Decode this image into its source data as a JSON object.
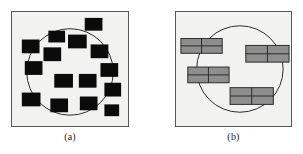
{
  "figure": {
    "background_color": "#ffffff",
    "width": 303,
    "height": 154
  },
  "panels": [
    {
      "id": "a",
      "caption": "(a)",
      "background_color": "#f2f2f0",
      "border_color": "#55555a",
      "query_circle": {
        "label": "query-region-circle",
        "cx": 59,
        "cy": 61,
        "r": 44,
        "stroke": "#2a2a2a",
        "stroke_width": 1,
        "fill": "none"
      },
      "object_shape": "square",
      "object_fill": "#0b0b0b",
      "objects": [
        {
          "name": "data-object-1",
          "x": 74,
          "y": 6,
          "w": 18,
          "h": 13
        },
        {
          "name": "data-object-2",
          "x": 37,
          "y": 19,
          "w": 17,
          "h": 12
        },
        {
          "name": "data-object-3",
          "x": 10,
          "y": 28,
          "w": 18,
          "h": 14
        },
        {
          "name": "data-object-4",
          "x": 57,
          "y": 23,
          "w": 19,
          "h": 14
        },
        {
          "name": "data-object-5",
          "x": 80,
          "y": 33,
          "w": 18,
          "h": 14
        },
        {
          "name": "data-object-6",
          "x": 32,
          "y": 36,
          "w": 18,
          "h": 14
        },
        {
          "name": "data-object-7",
          "x": 13,
          "y": 50,
          "w": 18,
          "h": 14
        },
        {
          "name": "data-object-8",
          "x": 90,
          "y": 52,
          "w": 18,
          "h": 14
        },
        {
          "name": "data-object-9",
          "x": 43,
          "y": 63,
          "w": 19,
          "h": 14
        },
        {
          "name": "data-object-10",
          "x": 68,
          "y": 63,
          "w": 18,
          "h": 14
        },
        {
          "name": "data-object-11",
          "x": 94,
          "y": 72,
          "w": 17,
          "h": 14
        },
        {
          "name": "data-object-12",
          "x": 10,
          "y": 82,
          "w": 19,
          "h": 14
        },
        {
          "name": "data-object-13",
          "x": 39,
          "y": 88,
          "w": 18,
          "h": 14
        },
        {
          "name": "data-object-14",
          "x": 69,
          "y": 86,
          "w": 18,
          "h": 14
        },
        {
          "name": "data-object-15",
          "x": 94,
          "y": 94,
          "w": 15,
          "h": 12
        }
      ]
    },
    {
      "id": "b",
      "caption": "(b)",
      "background_color": "#f2f2f0",
      "border_color": "#55555a",
      "query_circle": {
        "label": "query-region-circle",
        "cx": 65,
        "cy": 58,
        "r": 44,
        "stroke": "#2a2a2a",
        "stroke_width": 1,
        "fill": "none"
      },
      "object_shape": "subdivided-rectangle",
      "object_fill": "#8e8e8e",
      "object_stroke": "#2a2a2a",
      "objects": [
        {
          "name": "bounding-box-1",
          "x": 5,
          "y": 27,
          "w": 42,
          "h": 15,
          "cols": 2,
          "rows": 2
        },
        {
          "name": "bounding-box-2",
          "x": 71,
          "y": 34,
          "w": 44,
          "h": 17,
          "cols": 2,
          "rows": 2
        },
        {
          "name": "bounding-box-3",
          "x": 12,
          "y": 56,
          "w": 42,
          "h": 16,
          "cols": 2,
          "rows": 2
        },
        {
          "name": "bounding-box-4",
          "x": 55,
          "y": 77,
          "w": 44,
          "h": 17,
          "cols": 2,
          "rows": 2
        }
      ]
    }
  ]
}
